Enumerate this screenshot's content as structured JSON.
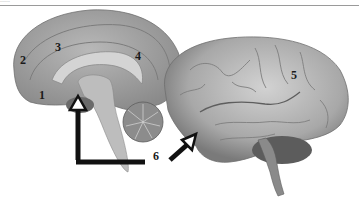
{
  "figure": {
    "top_caption_fragment": "........",
    "labels": [
      {
        "id": "1",
        "text": "1",
        "x": 39,
        "y": 88
      },
      {
        "id": "2",
        "text": "2",
        "x": 20,
        "y": 53
      },
      {
        "id": "3",
        "text": "3",
        "x": 55,
        "y": 40
      },
      {
        "id": "4",
        "text": "4",
        "x": 135,
        "y": 49
      },
      {
        "id": "5",
        "text": "5",
        "x": 291,
        "y": 68
      },
      {
        "id": "6",
        "text": "6",
        "x": 153,
        "y": 149
      }
    ],
    "images": [
      {
        "name": "midsagittal-brain-section",
        "description": "Medial view of sagittally sectioned brain with cerebellum"
      },
      {
        "name": "lateral-brain-view",
        "description": "Lateral view of whole brain with brainstem and cerebellum"
      }
    ],
    "arrows": [
      {
        "name": "arrow-6-elbow",
        "target": "brainstem"
      },
      {
        "name": "arrow-6-diagonal",
        "target": "temporal-lobe"
      }
    ],
    "colors": {
      "brain_gray": "#a9a9a9",
      "brain_light": "#c8c8c8",
      "brain_dark": "#6e6e6e",
      "arrow": "#111111",
      "background": "#ffffff"
    }
  }
}
